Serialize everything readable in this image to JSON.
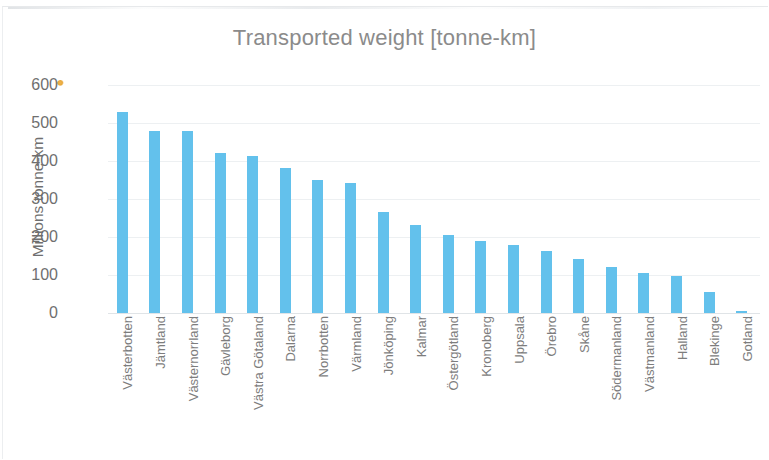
{
  "chart_data": {
    "type": "bar",
    "title": "Transported weight [tonne-km]",
    "xlabel": "",
    "ylabel": "Millions tonne-km",
    "ylim": [
      0,
      600
    ],
    "yticks": [
      600,
      500,
      400,
      300,
      200,
      100,
      0
    ],
    "grid": true,
    "legend": "none",
    "bar_color": "#63c1ec",
    "categories": [
      "Västerbotten",
      "Jämtland",
      "Västernorrland",
      "Gävleborg",
      "Västra Götaland",
      "Dalarna",
      "Norrbotten",
      "Värmland",
      "Jönköping",
      "Kalmar",
      "Östergötland",
      "Kronoberg",
      "Uppsala",
      "Örebro",
      "Skåne",
      "Södermanland",
      "Västmanland",
      "Halland",
      "Blekinge",
      "Gotland"
    ],
    "values": [
      530,
      480,
      478,
      422,
      413,
      381,
      350,
      341,
      267,
      231,
      205,
      190,
      180,
      163,
      142,
      122,
      104,
      97,
      55,
      5
    ]
  },
  "colors": {
    "bar": "#63c1ec",
    "title_text": "#8b8b8b",
    "axis_text": "#6f6f6f",
    "gridline": "#edf0f2",
    "background": "#ffffff"
  }
}
